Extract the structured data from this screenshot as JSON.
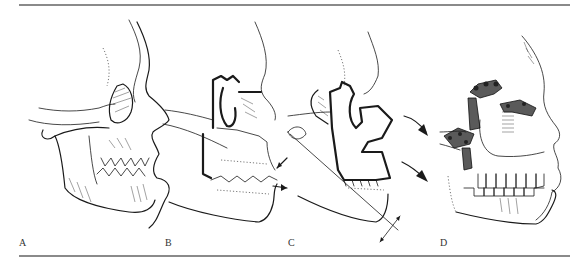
{
  "figure": {
    "panels": [
      {
        "id": "A",
        "label": "A",
        "description": "Preoperative lateral skull profile with midface retrusion"
      },
      {
        "id": "B",
        "label": "B",
        "description": "Osteotomy lines marked (bold) with occlusal arrows"
      },
      {
        "id": "C",
        "label": "C",
        "description": "Midface segment advanced forward; arrows show direction of advancement"
      },
      {
        "id": "D",
        "label": "D",
        "description": "Midface fixed in advanced position with plates and screws"
      }
    ],
    "colors": {
      "rule": "#8a8a8a",
      "ink": "#1a1a1a",
      "label": "#333333"
    }
  }
}
